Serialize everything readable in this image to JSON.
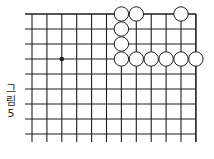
{
  "figure": {
    "caption_chars": [
      "그",
      "림",
      "5"
    ],
    "caption": "그림 5"
  },
  "board": {
    "line_color": "#1e1e1e",
    "stone_stroke": "#1e1e1e",
    "stone_fill": "#ffffff",
    "star_color": "#1e1e1e",
    "origin_x": 32,
    "origin_y": 14,
    "spacing_x": 14.9,
    "spacing_y": 15,
    "cols": 12,
    "rows": 9,
    "left_overhang": 7,
    "bottom_overhang": 8,
    "top_edge": true,
    "right_edge": true,
    "stone_radius": 7.2,
    "star_points": [
      {
        "col": 2,
        "row": 3
      }
    ],
    "white_stones": [
      {
        "col": 6,
        "row": 0
      },
      {
        "col": 7,
        "row": 0
      },
      {
        "col": 10,
        "row": 0
      },
      {
        "col": 6,
        "row": 1
      },
      {
        "col": 6,
        "row": 2
      },
      {
        "col": 6,
        "row": 3
      },
      {
        "col": 7,
        "row": 3
      },
      {
        "col": 8,
        "row": 3
      },
      {
        "col": 9,
        "row": 3
      },
      {
        "col": 10,
        "row": 3
      },
      {
        "col": 11,
        "row": 3
      }
    ]
  }
}
